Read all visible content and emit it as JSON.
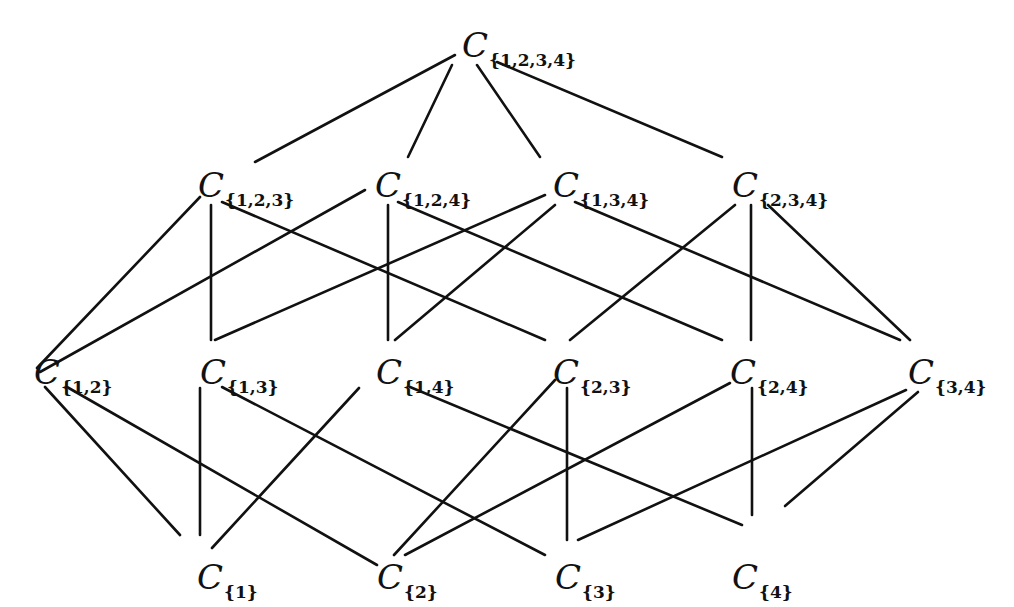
{
  "diagram": {
    "nodes": [
      {
        "id": "1234",
        "label": "C",
        "sub": "{1,2,3,4}",
        "x": 462,
        "y": 28
      },
      {
        "id": "123",
        "label": "C",
        "sub": "{1,2,3}",
        "x": 198,
        "y": 168
      },
      {
        "id": "124",
        "label": "C",
        "sub": "{1,2,4}",
        "x": 375,
        "y": 168
      },
      {
        "id": "134",
        "label": "C",
        "sub": "{1,3,4}",
        "x": 553,
        "y": 168
      },
      {
        "id": "234",
        "label": "C",
        "sub": "{2,3,4}",
        "x": 732,
        "y": 168
      },
      {
        "id": "12",
        "label": "C",
        "sub": "{1,2}",
        "x": 34,
        "y": 355
      },
      {
        "id": "13",
        "label": "C",
        "sub": "{1,3}",
        "x": 200,
        "y": 355
      },
      {
        "id": "14",
        "label": "C",
        "sub": "{1,4}",
        "x": 376,
        "y": 355
      },
      {
        "id": "23",
        "label": "C",
        "sub": "{2,3}",
        "x": 553,
        "y": 355
      },
      {
        "id": "24",
        "label": "C",
        "sub": "{2,4}",
        "x": 730,
        "y": 355
      },
      {
        "id": "34",
        "label": "C",
        "sub": "{3,4}",
        "x": 908,
        "y": 355
      },
      {
        "id": "1",
        "label": "C",
        "sub": "{1}",
        "x": 197,
        "y": 560
      },
      {
        "id": "2",
        "label": "C",
        "sub": "{2}",
        "x": 377,
        "y": 560
      },
      {
        "id": "3",
        "label": "C",
        "sub": "{3}",
        "x": 555,
        "y": 560
      },
      {
        "id": "4",
        "label": "C",
        "sub": "{4}",
        "x": 732,
        "y": 560
      }
    ],
    "edges": [
      {
        "from": "1234",
        "to": "123",
        "x1": 455,
        "y1": 55,
        "x2": 255,
        "y2": 162
      },
      {
        "from": "1234",
        "to": "124",
        "x1": 452,
        "y1": 65,
        "x2": 408,
        "y2": 157
      },
      {
        "from": "1234",
        "to": "134",
        "x1": 477,
        "y1": 65,
        "x2": 540,
        "y2": 157
      },
      {
        "from": "1234",
        "to": "234",
        "x1": 497,
        "y1": 62,
        "x2": 722,
        "y2": 157
      },
      {
        "from": "123",
        "to": "12",
        "x1": 200,
        "y1": 197,
        "x2": 37,
        "y2": 368
      },
      {
        "from": "123",
        "to": "13",
        "x1": 211,
        "y1": 205,
        "x2": 211,
        "y2": 340
      },
      {
        "from": "123",
        "to": "23",
        "x1": 222,
        "y1": 202,
        "x2": 545,
        "y2": 340
      },
      {
        "from": "124",
        "to": "12",
        "x1": 365,
        "y1": 190,
        "x2": 40,
        "y2": 372
      },
      {
        "from": "124",
        "to": "14",
        "x1": 388,
        "y1": 205,
        "x2": 388,
        "y2": 340
      },
      {
        "from": "124",
        "to": "24",
        "x1": 398,
        "y1": 202,
        "x2": 722,
        "y2": 340
      },
      {
        "from": "134",
        "to": "13",
        "x1": 545,
        "y1": 195,
        "x2": 215,
        "y2": 340
      },
      {
        "from": "134",
        "to": "14",
        "x1": 555,
        "y1": 205,
        "x2": 395,
        "y2": 340
      },
      {
        "from": "134",
        "to": "34",
        "x1": 575,
        "y1": 202,
        "x2": 900,
        "y2": 340
      },
      {
        "from": "234",
        "to": "23",
        "x1": 735,
        "y1": 205,
        "x2": 570,
        "y2": 340
      },
      {
        "from": "234",
        "to": "24",
        "x1": 751,
        "y1": 205,
        "x2": 751,
        "y2": 340
      },
      {
        "from": "234",
        "to": "34",
        "x1": 768,
        "y1": 205,
        "x2": 910,
        "y2": 340
      },
      {
        "from": "12",
        "to": "1",
        "x1": 45,
        "y1": 387,
        "x2": 180,
        "y2": 535
      },
      {
        "from": "12",
        "to": "2",
        "x1": 67,
        "y1": 387,
        "x2": 377,
        "y2": 565
      },
      {
        "from": "13",
        "to": "1",
        "x1": 200,
        "y1": 388,
        "x2": 200,
        "y2": 535
      },
      {
        "from": "13",
        "to": "3",
        "x1": 222,
        "y1": 387,
        "x2": 545,
        "y2": 555
      },
      {
        "from": "14",
        "to": "1",
        "x1": 359,
        "y1": 388,
        "x2": 212,
        "y2": 548
      },
      {
        "from": "14",
        "to": "4",
        "x1": 410,
        "y1": 387,
        "x2": 742,
        "y2": 525
      },
      {
        "from": "23",
        "to": "2",
        "x1": 555,
        "y1": 380,
        "x2": 394,
        "y2": 555
      },
      {
        "from": "23",
        "to": "3",
        "x1": 567,
        "y1": 388,
        "x2": 567,
        "y2": 540
      },
      {
        "from": "24",
        "to": "2",
        "x1": 730,
        "y1": 383,
        "x2": 405,
        "y2": 555
      },
      {
        "from": "24",
        "to": "4",
        "x1": 752,
        "y1": 388,
        "x2": 752,
        "y2": 515
      },
      {
        "from": "34",
        "to": "3",
        "x1": 906,
        "y1": 390,
        "x2": 578,
        "y2": 540
      },
      {
        "from": "34",
        "to": "4",
        "x1": 918,
        "y1": 392,
        "x2": 785,
        "y2": 506
      }
    ],
    "stroke_color": "#111111"
  }
}
